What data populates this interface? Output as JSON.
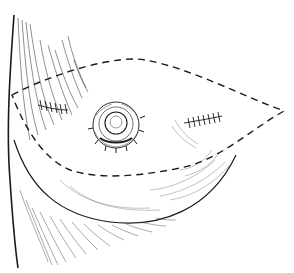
{
  "figure": {
    "type": "surgical-illustration",
    "colors": {
      "background": "#ffffff",
      "ink": "#1a1a1a",
      "hatch": "#555555"
    },
    "elements": [
      "chest-wall-contour",
      "breast-lower-contour",
      "dashed-incision-outline",
      "areola-nipple",
      "left-suture-mark",
      "right-suture-mark"
    ]
  }
}
